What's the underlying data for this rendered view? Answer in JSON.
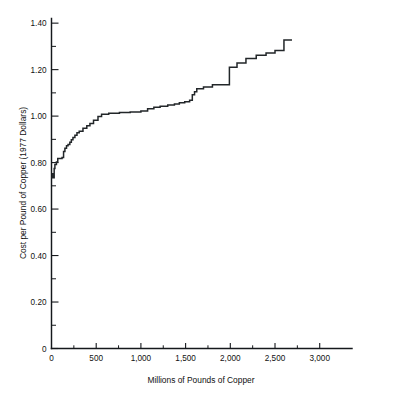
{
  "chart_data": {
    "type": "line",
    "title": "",
    "subtitle": "",
    "xlabel": "Millions of Pounds of Copper",
    "ylabel": "Cost per Pound of Copper (1977 Dollars)",
    "xlim": [
      0,
      3350
    ],
    "ylim": [
      0,
      1.42
    ],
    "grid": false,
    "legend": null,
    "style": "step-function supply curve",
    "x_ticks": [
      0,
      500,
      1000,
      1500,
      2000,
      2500,
      3000
    ],
    "x_tick_labels": [
      "0",
      "500",
      "1,000",
      "1,500",
      "2,000",
      "2,500",
      "3,000"
    ],
    "x_minor_tick_interval": 250,
    "y_ticks": [
      0,
      0.2,
      0.4,
      0.6,
      0.8,
      1.0,
      1.2,
      1.4
    ],
    "y_tick_labels": [
      "0",
      "0.20",
      "0.40",
      "0.60",
      "0.80",
      "1.00",
      "1.20",
      "1.40"
    ],
    "y_minor_tick_interval": 0.1,
    "line_color": "#222629",
    "series": [
      {
        "name": "Copper supply cost curve",
        "step_type": "post",
        "x": [
          0,
          12,
          12,
          20,
          20,
          30,
          30,
          38,
          38,
          55,
          55,
          70,
          70,
          118,
          118,
          135,
          135,
          150,
          150,
          168,
          168,
          185,
          185,
          205,
          205,
          222,
          222,
          240,
          240,
          262,
          262,
          285,
          285,
          310,
          310,
          352,
          352,
          395,
          395,
          430,
          430,
          470,
          470,
          520,
          520,
          560,
          560,
          640,
          640,
          760,
          760,
          880,
          880,
          1000,
          1000,
          1075,
          1075,
          1145,
          1145,
          1215,
          1215,
          1300,
          1300,
          1375,
          1375,
          1430,
          1430,
          1490,
          1490,
          1545,
          1545,
          1575,
          1575,
          1600,
          1600,
          1625,
          1625,
          1700,
          1700,
          1800,
          1800,
          1990,
          1990,
          2075,
          2075,
          2175,
          2175,
          2290,
          2290,
          2400,
          2400,
          2500,
          2500,
          2600,
          2600,
          2690
        ],
        "y": [
          0.735,
          0.735,
          0.752,
          0.752,
          0.735,
          0.735,
          0.775,
          0.775,
          0.792,
          0.792,
          0.802,
          0.802,
          0.818,
          0.818,
          0.822,
          0.822,
          0.848,
          0.848,
          0.862,
          0.862,
          0.872,
          0.872,
          0.878,
          0.878,
          0.888,
          0.888,
          0.898,
          0.898,
          0.908,
          0.908,
          0.918,
          0.918,
          0.928,
          0.928,
          0.935,
          0.935,
          0.948,
          0.948,
          0.958,
          0.958,
          0.968,
          0.968,
          0.982,
          0.982,
          0.998,
          0.998,
          1.008,
          1.008,
          1.012,
          1.012,
          1.016,
          1.016,
          1.018,
          1.018,
          1.022,
          1.022,
          1.032,
          1.032,
          1.038,
          1.038,
          1.042,
          1.042,
          1.048,
          1.048,
          1.052,
          1.052,
          1.058,
          1.058,
          1.062,
          1.062,
          1.068,
          1.068,
          1.092,
          1.092,
          1.105,
          1.105,
          1.118,
          1.118,
          1.125,
          1.125,
          1.135,
          1.135,
          1.21,
          1.21,
          1.228,
          1.228,
          1.248,
          1.248,
          1.262,
          1.262,
          1.272,
          1.272,
          1.282,
          1.282,
          1.328,
          1.328
        ]
      }
    ],
    "annotations": []
  }
}
